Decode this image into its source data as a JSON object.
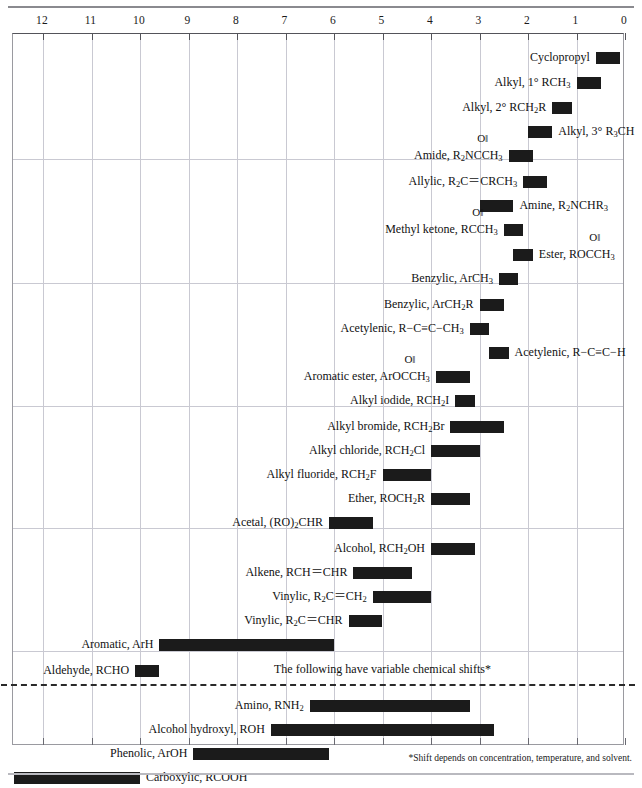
{
  "axis": {
    "label": "ppm",
    "ticks": [
      12,
      11,
      10,
      9,
      8,
      7,
      6,
      5,
      4,
      3,
      2,
      1,
      0
    ],
    "direction": "right-to-left",
    "min": 0,
    "max": 13
  },
  "notes": {
    "variable_shift_note": "The following have variable chemical shifts*",
    "footnote": "*Shift depends on concentration, temperature, and solvent."
  },
  "chart_data": {
    "type": "bar",
    "orientation": "horizontal-range",
    "title": "",
    "xlabel": "ppm",
    "ylabel": "",
    "xlim": [
      13,
      0
    ],
    "grid": true,
    "legend": null,
    "bar_color": "#1b1b1b",
    "categories": [
      "Cyclopropyl",
      "Alkyl, 1° RCH3",
      "Alkyl, 2° RCH2R",
      "Alkyl, 3° R3CH",
      "Amide, R2NCCH3",
      "Allylic, R2C=CRCH3",
      "Amine, R2NCHR3",
      "Methyl ketone, RCCH3",
      "Ester, ROCCH3",
      "Benzylic, ArCH3",
      "Benzylic, ArCH2R",
      "Acetylenic, R-C≡C-CH3",
      "Acetylenic, R-C≡C-H",
      "Aromatic ester, ArOCCH3",
      "Alkyl iodide, RCH2I",
      "Alkyl bromide, RCH2Br",
      "Alkyl chloride, RCH2Cl",
      "Alkyl fluoride, RCH2F",
      "Ether, ROCH2R",
      "Acetal, (RO)2CHR",
      "Alcohol, RCH2OH",
      "Alkene, RCH=CHR",
      "Vinylic, R2C=CH2",
      "Vinylic, R2C=CHR",
      "Aromatic, ArH",
      "Aldehyde, RCHO",
      "Amino, RNH2",
      "Alcohol hydroxyl, ROH",
      "Phenolic, ArOH",
      "Carboxylic, RCOOH"
    ],
    "ranges_ppm": [
      [
        0.1,
        0.6
      ],
      [
        0.5,
        1.0
      ],
      [
        1.1,
        1.5
      ],
      [
        1.5,
        2.0
      ],
      [
        1.9,
        2.4
      ],
      [
        1.6,
        2.1
      ],
      [
        2.3,
        3.0
      ],
      [
        2.1,
        2.5
      ],
      [
        1.9,
        2.3
      ],
      [
        2.2,
        2.6
      ],
      [
        2.5,
        3.0
      ],
      [
        2.8,
        3.2
      ],
      [
        2.4,
        2.8
      ],
      [
        3.2,
        3.9
      ],
      [
        3.1,
        3.5
      ],
      [
        2.5,
        3.6
      ],
      [
        3.0,
        4.0
      ],
      [
        4.0,
        5.0
      ],
      [
        3.2,
        4.0
      ],
      [
        5.2,
        6.1
      ],
      [
        3.1,
        4.0
      ],
      [
        4.4,
        5.6
      ],
      [
        4.0,
        5.2
      ],
      [
        5.0,
        5.7
      ],
      [
        6.0,
        9.6
      ],
      [
        9.6,
        10.1
      ],
      [
        3.2,
        6.5
      ],
      [
        2.7,
        7.3
      ],
      [
        6.1,
        8.9
      ],
      [
        10.0,
        12.6
      ]
    ],
    "sections": [
      {
        "name": "alkyl-group",
        "rows": [
          0,
          4
        ]
      },
      {
        "name": "allylic-carbonyl-group",
        "rows": [
          5,
          9
        ]
      },
      {
        "name": "benzylic-acetylenic-group",
        "rows": [
          10,
          14
        ]
      },
      {
        "name": "halide-ether-group",
        "rows": [
          15,
          19
        ]
      },
      {
        "name": "alcohol-alkene-group",
        "rows": [
          20,
          24
        ]
      },
      {
        "name": "aldehyde-group",
        "rows": [
          25,
          25
        ]
      },
      {
        "name": "variable-shift-group",
        "rows": [
          26,
          29
        ]
      }
    ]
  }
}
